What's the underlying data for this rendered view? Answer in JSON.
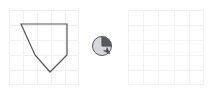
{
  "app": {
    "name": "shape-drawing-canvas",
    "background_color": "#ffffff",
    "width": 213,
    "height": 94
  },
  "left_canvas": {
    "name": "drawing-canvas-left",
    "x": 9,
    "y": 10,
    "width": 70,
    "height": 75,
    "grid": {
      "columns": 5,
      "rows": 5,
      "cell_width": 14,
      "cell_height": 15,
      "line_color": "#f0f0f2",
      "border_color": "#f0f0f2",
      "visible": true
    },
    "shape": {
      "name": "polygon-pentagon",
      "type": "polygon",
      "stroke_color": "#555559",
      "fill_color": "none",
      "stroke_width": 1.2,
      "points": [
        {
          "x": 12,
          "y": 14
        },
        {
          "x": 58,
          "y": 14
        },
        {
          "x": 58,
          "y": 45
        },
        {
          "x": 41,
          "y": 62
        },
        {
          "x": 26,
          "y": 45
        }
      ],
      "points_attr": "12,14 58,14 58,45 41,62 26,45"
    }
  },
  "right_canvas": {
    "name": "drawing-canvas-right",
    "x": 128,
    "y": 10,
    "width": 76,
    "height": 75,
    "grid": {
      "columns": 5,
      "rows": 5,
      "cell_width": 15.2,
      "cell_height": 15,
      "line_color": "#f2f2f4",
      "border_color": "#f2f2f4",
      "visible": true
    },
    "shape": null
  },
  "cursor": {
    "name": "pie-chart-cursor",
    "icon": "pie-chart-icon",
    "center_x": 102,
    "center_y": 46,
    "radius": 9.5,
    "circle_stroke": "#55555a",
    "circle_fill": "#d8d8dc",
    "wedge_fill": "#595960",
    "wedge_start_angle_deg": 0,
    "wedge_end_angle_deg": 90,
    "arrow": {
      "name": "arrow-pointer-icon",
      "tip_x": 110,
      "tip_y": 54,
      "color": "#4a4a50"
    }
  }
}
